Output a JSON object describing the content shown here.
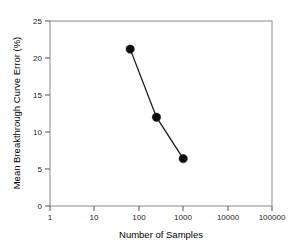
{
  "chart_data": {
    "type": "line",
    "title": "",
    "xlabel": "Number of Samples",
    "ylabel": "Mean Breakthrough Curve Error (%)",
    "xscale": "log",
    "yscale": "linear",
    "xlim": [
      1,
      100000
    ],
    "ylim": [
      0,
      25
    ],
    "grid": false,
    "legend": "none",
    "xticks": [
      1,
      10,
      100,
      1000,
      10000,
      100000
    ],
    "xtick_labels": [
      "1",
      "10",
      "100",
      "1000",
      "10000",
      "100000"
    ],
    "yticks": [
      0,
      5,
      10,
      15,
      20,
      25
    ],
    "ytick_labels": [
      "0",
      "5",
      "10",
      "15",
      "20",
      "25"
    ],
    "x": [
      64,
      250,
      1000
    ],
    "values": [
      21.2,
      12.0,
      6.4
    ],
    "series": [
      {
        "name": "Mean Breakthrough Curve Error",
        "x": [
          64,
          250,
          1000
        ],
        "values": [
          21.2,
          12.0,
          6.4
        ],
        "marker": "filled-circle",
        "color": "#0d0d0d"
      }
    ]
  },
  "colors": {
    "series": "#0d0d0d",
    "axis": "#8a8a8a",
    "tick": "#555555",
    "text": "#000000",
    "background": "#ffffff"
  }
}
